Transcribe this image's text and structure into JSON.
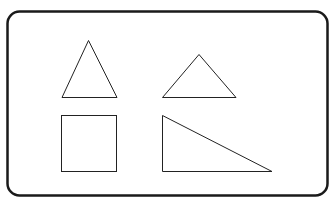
{
  "diagram": {
    "stroke_color": "#222222",
    "frame_color": "#1a1a1a",
    "background_color": "#ffffff",
    "shapes": [
      {
        "name": "isosceles-triangle-tall",
        "type": "triangle"
      },
      {
        "name": "isosceles-triangle-wide",
        "type": "triangle"
      },
      {
        "name": "square",
        "type": "square"
      },
      {
        "name": "right-triangle",
        "type": "right-triangle"
      }
    ]
  }
}
